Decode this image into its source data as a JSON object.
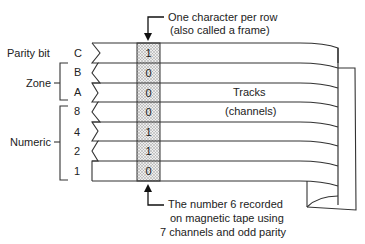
{
  "diagram": {
    "top_caption": {
      "line1": "One character per row",
      "line2": "(also called a frame)"
    },
    "bottom_caption": {
      "line1": "The number 6 recorded",
      "line2": "on magnetic tape using",
      "line3": "7 channels and odd parity"
    },
    "tracks_label": {
      "line1": "Tracks",
      "line2": "(channels)"
    },
    "group_labels": {
      "parity": "Parity bit",
      "zone": "Zone",
      "numeric": "Numeric"
    },
    "channels": [
      {
        "name": "C",
        "bit": "1",
        "group": "parity"
      },
      {
        "name": "B",
        "bit": "0",
        "group": "zone"
      },
      {
        "name": "A",
        "bit": "0",
        "group": "zone"
      },
      {
        "name": "8",
        "bit": "0",
        "group": "numeric"
      },
      {
        "name": "4",
        "bit": "1",
        "group": "numeric"
      },
      {
        "name": "2",
        "bit": "1",
        "group": "numeric"
      },
      {
        "name": "1",
        "bit": "0",
        "group": "numeric"
      }
    ],
    "colors": {
      "line": "#333333",
      "frame_fill": "#d9d9d9",
      "background": "#ffffff"
    }
  }
}
